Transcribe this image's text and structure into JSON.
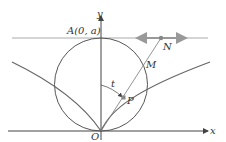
{
  "diagram": {
    "labels": {
      "y_axis": "y",
      "x_axis": "x",
      "point_A": "A(0, a)",
      "point_N": "N",
      "point_M": "M",
      "point_P": "P",
      "origin": "O",
      "angle": "t"
    },
    "colors": {
      "axes": "#444444",
      "circle": "#555555",
      "curve": "#666666",
      "line_y_a": "#999999",
      "arrow_accent": "#888888",
      "point_fill": "#888888"
    }
  }
}
